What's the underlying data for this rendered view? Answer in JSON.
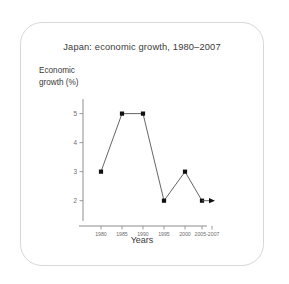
{
  "chart_data": {
    "type": "line",
    "title": "Japan: economic growth, 1980–2007",
    "xlabel": "Years",
    "ylabel": "Economic growth (%)",
    "ylabel_line1": "Economic",
    "ylabel_line2": "growth (%)",
    "categories": [
      "1980",
      "1985",
      "1990",
      "1995",
      "2000",
      "2005-2007"
    ],
    "x_tick_labels": [
      "1980",
      "1985",
      "1990",
      "1995",
      "2000",
      "2005-2007"
    ],
    "y_tick_labels": [
      "5",
      "4",
      "3",
      "2"
    ],
    "y_tick_values": [
      5,
      4,
      3,
      2
    ],
    "values": [
      3,
      5,
      5,
      2,
      3,
      2
    ],
    "points": [
      {
        "x": "1980",
        "y": 3
      },
      {
        "x": "1985",
        "y": 5
      },
      {
        "x": "1990",
        "y": 5
      },
      {
        "x": "1995",
        "y": 2
      },
      {
        "x": "2000",
        "y": 3
      },
      {
        "x": "2005",
        "y": 2
      },
      {
        "x": "2007",
        "y": 2
      }
    ],
    "ylim": [
      1.3,
      5.4
    ],
    "grid": false,
    "legend": "none",
    "marker": "square",
    "end_arrow": true,
    "line_color": "#555555",
    "marker_color": "#111111",
    "axis_color": "#8e8e8e",
    "text_color": "#3a3a3a",
    "tick_color": "#6d6d6d"
  },
  "card": {
    "border_color": "#d8d8d8",
    "background": "#ffffff"
  }
}
